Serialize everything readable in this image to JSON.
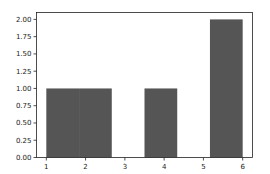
{
  "chart_data": {
    "type": "bar",
    "subtype": "histogram",
    "title": "",
    "xlabel": "",
    "ylabel": "",
    "xlim": [
      0.75,
      6.25
    ],
    "ylim": [
      0,
      2.1
    ],
    "grid": false,
    "legend": null,
    "bar_color": "#555555",
    "bins": [
      {
        "start": 1.0,
        "end": 1.8333,
        "count": 1
      },
      {
        "start": 1.8333,
        "end": 2.6667,
        "count": 1
      },
      {
        "start": 2.6667,
        "end": 3.5,
        "count": 0
      },
      {
        "start": 3.5,
        "end": 4.3333,
        "count": 1
      },
      {
        "start": 4.3333,
        "end": 5.1667,
        "count": 0
      },
      {
        "start": 5.1667,
        "end": 6.0,
        "count": 2
      }
    ],
    "categories": [
      "1.00-1.83",
      "1.83-2.67",
      "2.67-3.50",
      "3.50-4.33",
      "4.33-5.17",
      "5.17-6.00"
    ],
    "values": [
      1,
      1,
      0,
      1,
      0,
      2
    ],
    "x_ticks": [
      {
        "value": 1,
        "label": "1"
      },
      {
        "value": 2,
        "label": "2"
      },
      {
        "value": 3,
        "label": "3"
      },
      {
        "value": 4,
        "label": "4"
      },
      {
        "value": 5,
        "label": "5"
      },
      {
        "value": 6,
        "label": "6"
      }
    ],
    "y_ticks": [
      {
        "value": 0.0,
        "label": "0.00"
      },
      {
        "value": 0.25,
        "label": "0.25"
      },
      {
        "value": 0.5,
        "label": "0.50"
      },
      {
        "value": 0.75,
        "label": "0.75"
      },
      {
        "value": 1.0,
        "label": "1.00"
      },
      {
        "value": 1.25,
        "label": "1.25"
      },
      {
        "value": 1.5,
        "label": "1.50"
      },
      {
        "value": 1.75,
        "label": "1.75"
      },
      {
        "value": 2.0,
        "label": "2.00"
      }
    ]
  }
}
